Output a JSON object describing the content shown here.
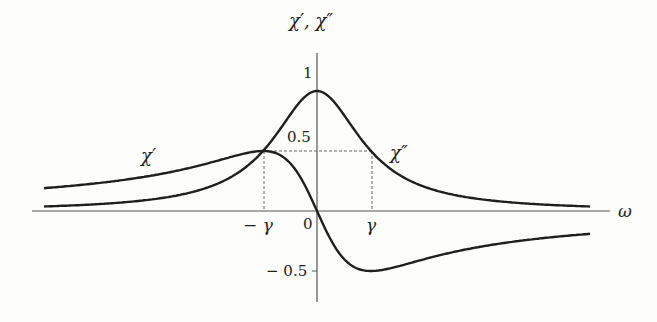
{
  "chart_data": {
    "type": "line",
    "title": "",
    "xlabel": "ω",
    "ylabel": "χ′, χ″",
    "x_ticks": [
      "−γ",
      "0",
      "γ"
    ],
    "y_ticks": [
      "1",
      "0.5",
      "−0.5"
    ],
    "x_range_in_gamma": [
      -5.0,
      5.1
    ],
    "ylim": [
      -0.6,
      1.1
    ],
    "grid": false,
    "legend": "inline labels",
    "gamma": 1,
    "series": [
      {
        "name": "χ′",
        "formula": "(ω/γ)/(1+(ω/γ)²)",
        "x": [
          -5,
          -3,
          -2,
          -1,
          -0.5,
          0,
          0.5,
          1,
          2,
          3,
          5
        ],
        "values": [
          -0.19,
          -0.3,
          -0.4,
          -0.5,
          -0.4,
          0,
          0.4,
          0.5,
          0.4,
          0.3,
          0.19
        ],
        "note": "dispersive curve, max 0.5 at ω=γ, min −0.5 at ω=−γ (as drawn: rises to 0.5 at −γ and falls to −0.5 at +γ)"
      },
      {
        "name": "χ″",
        "formula": "1/(1+(ω/γ)²)",
        "x": [
          -5,
          -3,
          -2,
          -1,
          -0.5,
          0,
          0.5,
          1,
          2,
          3,
          5
        ],
        "values": [
          0.04,
          0.1,
          0.2,
          0.5,
          0.8,
          1,
          0.8,
          0.5,
          0.2,
          0.1,
          0.04
        ],
        "note": "absorptive Lorentzian, peak 1 at ω=0, 0.5 at ω=±γ"
      }
    ],
    "annotations": [
      {
        "type": "dashed",
        "from": "(−γ,0)",
        "to": "(−γ,0.5)"
      },
      {
        "type": "dashed",
        "from": "(−γ,0.5)",
        "to": "(γ,0.5)"
      },
      {
        "type": "dashed",
        "from": "(γ,0)",
        "to": "(γ,0.5)"
      }
    ]
  },
  "labels": {
    "y_axis": "χ′, χ″",
    "x_axis": "ω",
    "chi_prime": "χ′",
    "chi_double_prime": "χ″",
    "tick_1": "1",
    "tick_half": "0.5",
    "tick_neg_half": "− 0.5",
    "tick_neg_gamma": "− γ",
    "tick_zero": "0",
    "tick_gamma": "γ"
  },
  "colors": {
    "curve": "#1f1f1f",
    "axis": "#444444",
    "dash": "#555555",
    "background": "#fdfdfb"
  }
}
